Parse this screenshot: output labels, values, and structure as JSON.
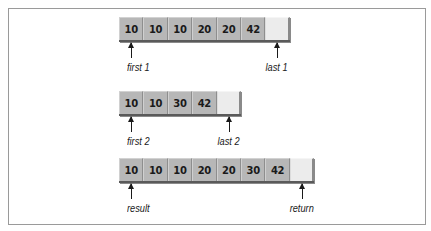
{
  "diagram": {
    "type": "merge illustration",
    "arrays": [
      {
        "id": "range1",
        "values": [
          "10",
          "10",
          "10",
          "20",
          "20",
          "42",
          ""
        ],
        "pointers": [
          {
            "label": "first 1",
            "index": 0
          },
          {
            "label": "last 1",
            "index": 6
          }
        ]
      },
      {
        "id": "range2",
        "values": [
          "10",
          "10",
          "30",
          "42",
          ""
        ],
        "pointers": [
          {
            "label": "first 2",
            "index": 0
          },
          {
            "label": "last 2",
            "index": 4
          }
        ]
      },
      {
        "id": "result",
        "values": [
          "10",
          "10",
          "10",
          "20",
          "20",
          "30",
          "42",
          ""
        ],
        "pointers": [
          {
            "label": "result",
            "index": 0
          },
          {
            "label": "return",
            "index": 7
          }
        ]
      }
    ]
  },
  "colors": {
    "filled_cell": "#b7b7b7",
    "empty_cell": "#ececec",
    "shadow": "#5a5a5a",
    "text": "#1a1a1a",
    "frame_border": "#9a9a9a"
  }
}
